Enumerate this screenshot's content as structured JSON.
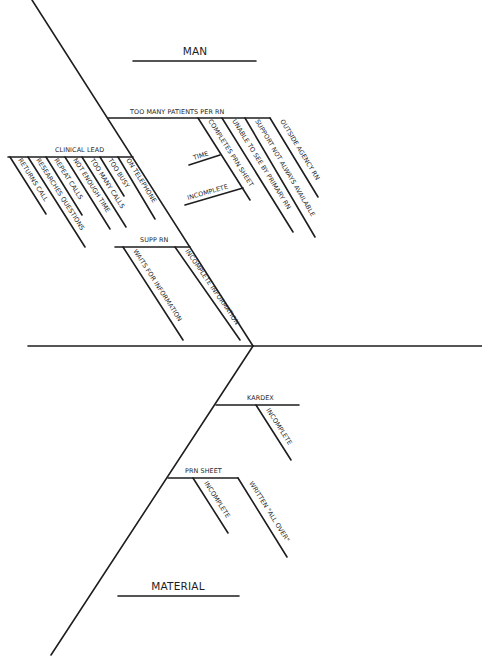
{
  "diagram": {
    "type": "fishbone",
    "categories": {
      "man": "MAN",
      "material": "MATERIAL"
    },
    "man_causes": [
      {
        "label": "TOO MANY PATIENTS PER RN",
        "sub_causes": [
          {
            "label": "COMPLETES PRN SHEET",
            "sub_causes": [
              {
                "label": "TIME"
              },
              {
                "label": "INCOMPLETE"
              }
            ]
          },
          {
            "label": "UNABLE TO SEE BY PRIMARY RN"
          },
          {
            "label": "SUPPORT NOT ALWAYS AVAILABLE"
          },
          {
            "label": "OUTSIDE AGENCY RN"
          }
        ]
      },
      {
        "label": "CLINICAL LEAD",
        "sub_causes": [
          {
            "label": "RETURNS CALL"
          },
          {
            "label": "RESEARCHES QUESTIONS"
          },
          {
            "label": "REPEAT CALLS"
          },
          {
            "label": "NOT ENOUGH TIME"
          },
          {
            "label": "TOO MANY CALLS"
          },
          {
            "label": "TOO BUSY"
          },
          {
            "label": "ON TELEPHONE"
          }
        ]
      },
      {
        "label": "SUPP RN",
        "sub_causes": [
          {
            "label": "WAITS FOR INFORMATION"
          },
          {
            "label": "INCOMPLETE INFORMATION"
          }
        ]
      }
    ],
    "material_causes": [
      {
        "label": "KARDEX",
        "sub_causes": [
          {
            "label": "INCOMPLETE"
          }
        ]
      },
      {
        "label": "PRN SHEET",
        "sub_causes": [
          {
            "label": "INCOMPLETE"
          },
          {
            "label": "WRITTEN \"ALL OVER\""
          }
        ]
      }
    ]
  }
}
